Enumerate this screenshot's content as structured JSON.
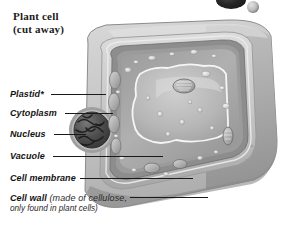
{
  "figure": {
    "title_line1": "Plant cell",
    "title_line2": "(cut away)",
    "style": "grayscale airbrush illustration"
  },
  "labels": [
    {
      "id": "plastid",
      "text": "Plastid*"
    },
    {
      "id": "cytoplasm",
      "text": "Cytoplasm"
    },
    {
      "id": "nucleus",
      "text": "Nucleus"
    },
    {
      "id": "vacuole",
      "text": "Vacuole"
    },
    {
      "id": "cell_membrane",
      "text": "Cell membrane"
    }
  ],
  "cell_wall_label": {
    "bold": "Cell wall",
    "note_open": " (made of ",
    "note_bold": "cellulose",
    "note_close": ",",
    "line2": "only found in plant cells)"
  },
  "colors": {
    "background": "#ffffff",
    "text": "#141414",
    "leader_line": "#1a1a1a",
    "wall_outer": "#cfcfcf",
    "wall_mid": "#b4b4b4",
    "membrane": "#8f8f8f",
    "cytoplasm": "#a8a8a8",
    "vacuole": "#bdbdbd",
    "nucleus": "#4f4f4f",
    "block_face": "#adadad",
    "block_top": "#c4c4c4",
    "highlight": "#f2f2f2"
  },
  "artifacts": [
    {
      "id": "dark-blob",
      "shape": "ellipse",
      "note": "cropped dark object at top edge"
    },
    {
      "id": "gray-sphere",
      "shape": "circle",
      "note": "small gray sphere at top edge"
    }
  ]
}
